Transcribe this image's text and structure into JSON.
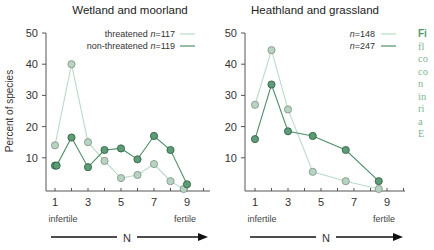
{
  "chart_data": [
    {
      "type": "line",
      "title": "Wetland and moorland",
      "xlabel": "N",
      "ylabel": "Percent of species",
      "x_axis_annotations": {
        "left": "infertile",
        "right": "fertile"
      },
      "xticks": [
        1,
        3,
        5,
        7,
        9
      ],
      "yticks": [
        10,
        20,
        30,
        40,
        50
      ],
      "ylim": [
        0,
        50
      ],
      "xlim": [
        0.5,
        9.8
      ],
      "grid": false,
      "legend_position": "top-right",
      "series": [
        {
          "name": "threatened",
          "legend": "threatened n=117",
          "n": 117,
          "style": "light",
          "x": [
            1,
            2,
            3,
            4,
            5,
            6,
            7,
            8,
            8.8
          ],
          "y": [
            14,
            40,
            15,
            9,
            3.5,
            4.5,
            8,
            2.5,
            0
          ]
        },
        {
          "name": "non-threatened",
          "legend": "non-threatened n=119",
          "n": 119,
          "style": "dark",
          "x": [
            1,
            1.1,
            2,
            3,
            4,
            5,
            6,
            7,
            8,
            9
          ],
          "y": [
            7.5,
            7.5,
            16.5,
            7,
            12.5,
            13,
            9.5,
            17,
            12.5,
            1.5
          ]
        }
      ]
    },
    {
      "type": "line",
      "title": "Heathland and grassland",
      "xlabel": "N",
      "ylabel": "",
      "x_axis_annotations": {
        "left": "infertile",
        "right": "fertile"
      },
      "xticks": [
        1,
        3,
        5,
        7,
        9
      ],
      "yticks": [
        10,
        20,
        30,
        40,
        50
      ],
      "ylim": [
        0,
        50
      ],
      "xlim": [
        0.5,
        9.8
      ],
      "grid": false,
      "legend_position": "top-right",
      "series": [
        {
          "name": "threatened",
          "legend": "n=148",
          "n": 148,
          "style": "light",
          "x": [
            1,
            2,
            3,
            4.5,
            6.5,
            8.5
          ],
          "y": [
            27,
            44.5,
            25.5,
            5.5,
            2.5,
            0
          ]
        },
        {
          "name": "non-threatened",
          "legend": "n=247",
          "n": 247,
          "style": "dark",
          "x": [
            1,
            2,
            3,
            4.5,
            6.5,
            8.5
          ],
          "y": [
            16,
            33.5,
            18.5,
            17,
            12.5,
            2.5
          ]
        }
      ]
    }
  ],
  "colors": {
    "light_line": "#b9dcc7",
    "light_marker_fill": "#b7d3c2",
    "light_marker_stroke": "#7d8f84",
    "dark_line": "#4f8f68",
    "dark_marker_fill": "#5c9c76",
    "dark_marker_stroke": "#2f5a40",
    "axis": "#555555",
    "caption": "#7fb594"
  },
  "caption_fragments": [
    "Fi",
    "fl",
    "co",
    "co",
    "n",
    "in",
    "ri",
    "a",
    "E"
  ]
}
